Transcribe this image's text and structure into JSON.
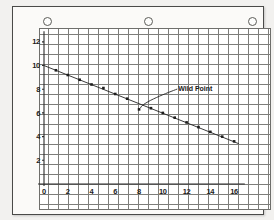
{
  "page": {
    "kind": "scanned-graph-paper-sheet",
    "punch_holes": 3
  },
  "chart_data": {
    "type": "scatter",
    "title": "",
    "xlabel": "",
    "ylabel": "",
    "xlim": [
      0,
      17
    ],
    "ylim": [
      0,
      13
    ],
    "grid": true,
    "legend": false,
    "x_ticks": [
      "0",
      "2",
      "4",
      "6",
      "8",
      "10",
      "12",
      "14",
      "16"
    ],
    "x_tick_values": [
      0,
      2,
      4,
      6,
      8,
      10,
      12,
      14,
      16
    ],
    "y_ticks": [
      "2",
      "4",
      "6",
      "8",
      "10",
      "12"
    ],
    "y_tick_values": [
      2,
      4,
      6,
      8,
      10,
      12
    ],
    "series": [
      {
        "name": "measurements",
        "x": [
          1,
          2,
          3,
          4,
          5,
          6,
          7,
          8,
          9,
          10,
          11,
          12,
          13,
          14,
          15,
          16
        ],
        "y": [
          9.6,
          9.2,
          8.8,
          8.4,
          8.1,
          7.6,
          7.2,
          6.3,
          6.4,
          6.0,
          5.6,
          5.2,
          4.8,
          4.4,
          4.0,
          3.6
        ]
      }
    ],
    "fit_line": {
      "name": "trend",
      "x0": 0,
      "y0": 10.0,
      "x1": 16.4,
      "y1": 3.4
    },
    "annotations": [
      {
        "text": "Wild Point",
        "target_x": 8,
        "target_y": 6.3,
        "label_x": 11.3,
        "label_y": 8.1
      }
    ]
  },
  "colors": {
    "ink": "#1d1d1d",
    "grid_major": "#7d7d7a",
    "grid_minor": "#bcbcb9",
    "paper": "#fbfaf8",
    "backdrop": "#f2f1ef"
  }
}
